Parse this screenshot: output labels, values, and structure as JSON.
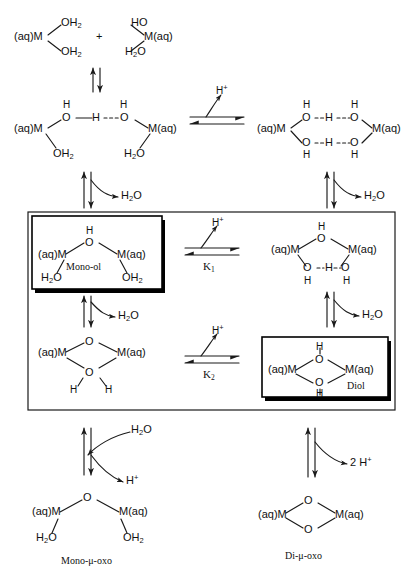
{
  "species": {
    "top_left": {
      "m_label": "(aq)M",
      "ligand_upper": "OH",
      "ligand_upper_sub": "2",
      "ligand_lower": "OH",
      "ligand_lower_sub": "2"
    },
    "plus_sign": "+",
    "top_right": {
      "m_label": "M(aq)",
      "ligand_upper": "HO",
      "ligand_lower": "H",
      "ligand_lower_sub": "2",
      "ligand_lower_tail": "O"
    },
    "hbond_mono": {
      "m_left": "(aq)M",
      "m_right": "M(aq)",
      "h_top_left": "H",
      "h_top_right": "H",
      "o_left": "O",
      "bridge_h": "H",
      "o_right": "O",
      "leg_left": "OH",
      "leg_left_sub": "2",
      "leg_right": "H",
      "leg_right_sub": "2",
      "leg_right_tail": "O"
    },
    "hbond_di": {
      "m_left": "(aq)M",
      "m_right": "M(aq)",
      "h_top_left": "H",
      "h_top_right": "H",
      "o_top_left": "O",
      "bridge_h_top": "H",
      "o_top_right": "O",
      "o_bot_left": "O",
      "bridge_h_bot": "H",
      "o_bot_right": "O",
      "h_bot_left": "H",
      "h_bot_right": "H"
    },
    "mono_ol": {
      "m_left": "(aq)M",
      "m_right": "M(aq)",
      "bridge_h": "H",
      "bridge_o": "O",
      "leg_left": "H",
      "leg_left_sub": "2",
      "leg_left_tail": "O",
      "leg_right": "OH",
      "leg_right_sub": "2",
      "name": "Mono-ol"
    },
    "hydroxo_ol": {
      "m_left": "(aq)M",
      "m_right": "M(aq)",
      "bridge_h": "H",
      "bridge_o": "O",
      "o_left": "O",
      "bridge_h2": "H",
      "o_right": "O",
      "h_left": "H",
      "h_right": "H"
    },
    "diol_protonated": {
      "m_left": "(aq)M",
      "m_right": "M(aq)",
      "top_h": "H",
      "top_o": "O",
      "bot_o": "O",
      "h_left": "H",
      "h_right": "H"
    },
    "diol": {
      "m_left": "(aq)M",
      "m_right": "M(aq)",
      "top_h": "H",
      "top_o": "O",
      "bot_o": "O",
      "bot_h": "H",
      "name": "Diol"
    },
    "mono_oxo": {
      "m_left": "(aq)M",
      "m_right": "M(aq)",
      "bridge_o": "O",
      "leg_left": "H",
      "leg_left_sub": "2",
      "leg_left_tail": "O",
      "leg_right": "OH",
      "leg_right_sub": "2",
      "name": "Mono-μ-oxo"
    },
    "di_oxo": {
      "m_left": "(aq)M",
      "m_right": "M(aq)",
      "top_o": "O",
      "bot_o": "O",
      "name": "Di-μ-oxo"
    }
  },
  "annotations": {
    "proton_1": "H",
    "proton_1_sup": "+",
    "proton_2": "H",
    "proton_2_sup": "+",
    "proton_3": "H",
    "proton_3_sup": "+",
    "proton_4": "H",
    "proton_4_sup": "+",
    "proton_two": "2 H",
    "proton_two_sup": "+",
    "water_1": "H",
    "water_1_sub": "2",
    "water_1_tail": "O",
    "water_2": "H",
    "water_2_sub": "2",
    "water_2_tail": "O",
    "water_3": "H",
    "water_3_sub": "2",
    "water_3_tail": "O",
    "water_4": "H",
    "water_4_sub": "2",
    "water_4_tail": "O",
    "water_5": "H",
    "water_5_sub": "2",
    "water_5_tail": "O",
    "k1": "K",
    "k1_sub": "1",
    "k2": "K",
    "k2_sub": "2"
  },
  "colors": {
    "stroke": "#1a1a1a",
    "text": "#111111",
    "background": "#ffffff",
    "box_border": "#000000",
    "box_shadow": "#000000"
  }
}
